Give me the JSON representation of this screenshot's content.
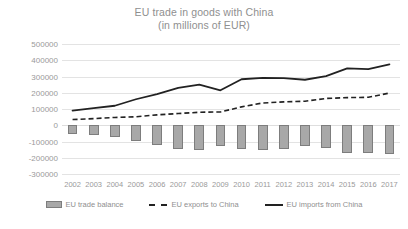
{
  "chart_data": {
    "type": "bar",
    "title": "EU trade in goods with China",
    "subtitle": "(in millions of EUR)",
    "xlabel": "",
    "ylabel": "",
    "ylim": [
      -300000,
      500000
    ],
    "ytick_step": 100000,
    "grid": true,
    "legend_position": "bottom",
    "categories": [
      "2002",
      "2003",
      "2004",
      "2005",
      "2006",
      "2007",
      "2008",
      "2009",
      "2010",
      "2011",
      "2012",
      "2013",
      "2014",
      "2015",
      "2016",
      "2017"
    ],
    "yticks": [
      "500000",
      "400000",
      "300000",
      "200000",
      "100000",
      "0",
      "-100000",
      "-200000",
      "-300000"
    ],
    "ytick_values": [
      500000,
      400000,
      300000,
      200000,
      100000,
      0,
      -100000,
      -200000,
      -300000
    ],
    "series": [
      {
        "name": "EU trade balance",
        "render": "bar",
        "color": "#a8a8a8",
        "border_color": "#7d7d7d",
        "values": [
          -55000,
          -62000,
          -70000,
          -98000,
          -120000,
          -148000,
          -155000,
          -130000,
          -146000,
          -152000,
          -144000,
          -130000,
          -140000,
          -172000,
          -168000,
          -175000
        ]
      },
      {
        "name": "EU exports to China",
        "render": "dashed-line",
        "color": "#222222",
        "values": [
          35000,
          41000,
          48000,
          52000,
          64000,
          72000,
          80000,
          82000,
          113000,
          137000,
          144000,
          148000,
          165000,
          170000,
          172000,
          198000
        ]
      },
      {
        "name": "EU imports from China",
        "render": "solid-line",
        "color": "#222222",
        "values": [
          90000,
          105000,
          120000,
          160000,
          192000,
          230000,
          250000,
          215000,
          283000,
          292000,
          290000,
          280000,
          302000,
          350000,
          345000,
          375000
        ]
      }
    ]
  },
  "legend": {
    "items": [
      {
        "label": "EU trade balance",
        "marker": "bar-swatch"
      },
      {
        "label": "EU exports to China",
        "marker": "dashed-line-swatch"
      },
      {
        "label": "EU imports from China",
        "marker": "solid-line-swatch"
      }
    ]
  }
}
